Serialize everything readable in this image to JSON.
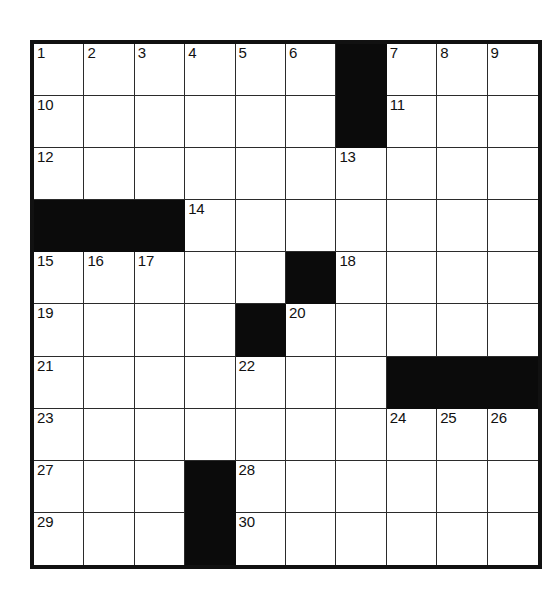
{
  "puzzle": {
    "type": "crossword-grid",
    "rows": 10,
    "cols": 10,
    "colors": {
      "page_background": "#ffffff",
      "cell_fill": "#ffffff",
      "block_fill": "#0b0b0b",
      "grid_line": "#2b2b2b",
      "outer_border": "#111111",
      "number_color": "#111111"
    },
    "highest_clue_number": 30,
    "grid": [
      [
        {
          "block": false,
          "number": "1"
        },
        {
          "block": false,
          "number": "2"
        },
        {
          "block": false,
          "number": "3"
        },
        {
          "block": false,
          "number": "4"
        },
        {
          "block": false,
          "number": "5"
        },
        {
          "block": false,
          "number": "6"
        },
        {
          "block": true,
          "number": ""
        },
        {
          "block": false,
          "number": "7"
        },
        {
          "block": false,
          "number": "8"
        },
        {
          "block": false,
          "number": "9"
        }
      ],
      [
        {
          "block": false,
          "number": "10"
        },
        {
          "block": false,
          "number": ""
        },
        {
          "block": false,
          "number": ""
        },
        {
          "block": false,
          "number": ""
        },
        {
          "block": false,
          "number": ""
        },
        {
          "block": false,
          "number": ""
        },
        {
          "block": true,
          "number": ""
        },
        {
          "block": false,
          "number": "11"
        },
        {
          "block": false,
          "number": ""
        },
        {
          "block": false,
          "number": ""
        }
      ],
      [
        {
          "block": false,
          "number": "12"
        },
        {
          "block": false,
          "number": ""
        },
        {
          "block": false,
          "number": ""
        },
        {
          "block": false,
          "number": ""
        },
        {
          "block": false,
          "number": ""
        },
        {
          "block": false,
          "number": ""
        },
        {
          "block": false,
          "number": "13"
        },
        {
          "block": false,
          "number": ""
        },
        {
          "block": false,
          "number": ""
        },
        {
          "block": false,
          "number": ""
        }
      ],
      [
        {
          "block": true,
          "number": ""
        },
        {
          "block": true,
          "number": ""
        },
        {
          "block": true,
          "number": ""
        },
        {
          "block": false,
          "number": "14"
        },
        {
          "block": false,
          "number": ""
        },
        {
          "block": false,
          "number": ""
        },
        {
          "block": false,
          "number": ""
        },
        {
          "block": false,
          "number": ""
        },
        {
          "block": false,
          "number": ""
        },
        {
          "block": false,
          "number": ""
        }
      ],
      [
        {
          "block": false,
          "number": "15"
        },
        {
          "block": false,
          "number": "16"
        },
        {
          "block": false,
          "number": "17"
        },
        {
          "block": false,
          "number": ""
        },
        {
          "block": false,
          "number": ""
        },
        {
          "block": true,
          "number": ""
        },
        {
          "block": false,
          "number": "18"
        },
        {
          "block": false,
          "number": ""
        },
        {
          "block": false,
          "number": ""
        },
        {
          "block": false,
          "number": ""
        }
      ],
      [
        {
          "block": false,
          "number": "19"
        },
        {
          "block": false,
          "number": ""
        },
        {
          "block": false,
          "number": ""
        },
        {
          "block": false,
          "number": ""
        },
        {
          "block": true,
          "number": ""
        },
        {
          "block": false,
          "number": "20"
        },
        {
          "block": false,
          "number": ""
        },
        {
          "block": false,
          "number": ""
        },
        {
          "block": false,
          "number": ""
        },
        {
          "block": false,
          "number": ""
        }
      ],
      [
        {
          "block": false,
          "number": "21"
        },
        {
          "block": false,
          "number": ""
        },
        {
          "block": false,
          "number": ""
        },
        {
          "block": false,
          "number": ""
        },
        {
          "block": false,
          "number": "22"
        },
        {
          "block": false,
          "number": ""
        },
        {
          "block": false,
          "number": ""
        },
        {
          "block": true,
          "number": ""
        },
        {
          "block": true,
          "number": ""
        },
        {
          "block": true,
          "number": ""
        }
      ],
      [
        {
          "block": false,
          "number": "23"
        },
        {
          "block": false,
          "number": ""
        },
        {
          "block": false,
          "number": ""
        },
        {
          "block": false,
          "number": ""
        },
        {
          "block": false,
          "number": ""
        },
        {
          "block": false,
          "number": ""
        },
        {
          "block": false,
          "number": ""
        },
        {
          "block": false,
          "number": "24"
        },
        {
          "block": false,
          "number": "25"
        },
        {
          "block": false,
          "number": "26"
        }
      ],
      [
        {
          "block": false,
          "number": "27"
        },
        {
          "block": false,
          "number": ""
        },
        {
          "block": false,
          "number": ""
        },
        {
          "block": true,
          "number": ""
        },
        {
          "block": false,
          "number": "28"
        },
        {
          "block": false,
          "number": ""
        },
        {
          "block": false,
          "number": ""
        },
        {
          "block": false,
          "number": ""
        },
        {
          "block": false,
          "number": ""
        },
        {
          "block": false,
          "number": ""
        }
      ],
      [
        {
          "block": false,
          "number": "29"
        },
        {
          "block": false,
          "number": ""
        },
        {
          "block": false,
          "number": ""
        },
        {
          "block": true,
          "number": ""
        },
        {
          "block": false,
          "number": "30"
        },
        {
          "block": false,
          "number": ""
        },
        {
          "block": false,
          "number": ""
        },
        {
          "block": false,
          "number": ""
        },
        {
          "block": false,
          "number": ""
        },
        {
          "block": false,
          "number": ""
        }
      ]
    ]
  }
}
